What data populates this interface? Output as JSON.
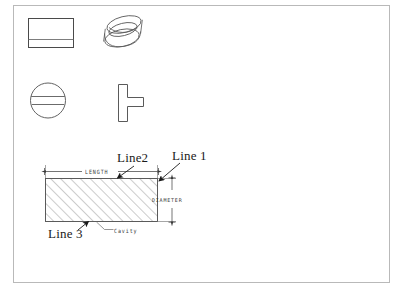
{
  "drawing": {
    "title": "Cylindrical part with cavity — orthographic views and dimensioned section",
    "frame": {
      "name": "drawing-border"
    },
    "views": [
      {
        "id": "top-left-rect",
        "name": "front-view-rectangle",
        "description": "rectangle with horizontal parting line"
      },
      {
        "id": "top-right-cyl",
        "name": "isometric-cylinder",
        "description": "3D pictorial view of cylinder"
      },
      {
        "id": "mid-left-circle",
        "name": "end-view-circle",
        "description": "circle with two horizontal lines"
      },
      {
        "id": "mid-right-tee",
        "name": "tee-profile",
        "description": "sideways T shaped profile"
      }
    ],
    "labels": {
      "line1": "Line 1",
      "line2": "Line2",
      "line3": "Line 3",
      "cavity": "Cavity"
    },
    "dimensions": {
      "length": "LENGTH",
      "diameter": "DIAMETER"
    },
    "colors": {
      "border": "#b9b9b9",
      "geometry": "#4a4a4a",
      "hatch": "#6b6b6b",
      "text": "#1a1a1a",
      "cad_text": "#3a3a3a",
      "background": "#ffffff"
    }
  }
}
